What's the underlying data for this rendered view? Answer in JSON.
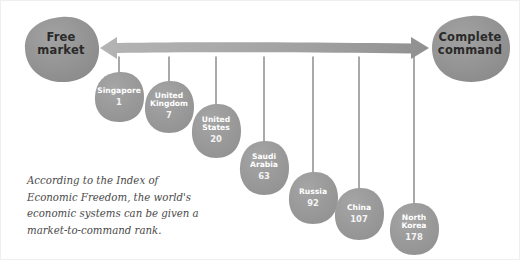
{
  "diagram": {
    "left_pole": {
      "line1": "Free",
      "line2": "market"
    },
    "right_pole": {
      "line1": "Complete",
      "line2": "command"
    },
    "axis": {
      "style": "double-headed-arrow",
      "direction": "bidirectional"
    },
    "caption": {
      "line1": "According to the Index of",
      "line2": "Economic Freedom, the world's",
      "line3": "economic systems can be given a",
      "line4": "market-to-command rank."
    },
    "colors": {
      "pole_blob": "#8f8f8f",
      "node_blob": "#9a9a9a",
      "arrow": "#a6a6a6",
      "stem": "#8c8c8c",
      "node_text": "#ffffff",
      "pole_text": "#2a2a2a",
      "caption_text": "#4a4a4a",
      "background": "#ffffff"
    }
  },
  "chart_data": {
    "type": "scatter",
    "xlabel": "Free market  ↔  Complete command",
    "ylabel": "Index of Economic Freedom rank",
    "categories": [
      "Singapore",
      "United Kingdom",
      "United States",
      "Saudi Arabia",
      "Russia",
      "China",
      "North Korea"
    ],
    "values": [
      1,
      7,
      20,
      63,
      92,
      107,
      178
    ],
    "nodes": [
      {
        "name_line1": "Singapore",
        "name_line2": "",
        "rank": "1",
        "x": 118,
        "y": 96,
        "rx": 24,
        "ry": 25,
        "stem_x": 118,
        "stem_top": 56,
        "stem_bottom": 74
      },
      {
        "name_line1": "United",
        "name_line2": "Kingdom",
        "rank": "7",
        "x": 168,
        "y": 106,
        "rx": 24,
        "ry": 26,
        "stem_x": 168,
        "stem_top": 56,
        "stem_bottom": 82
      },
      {
        "name_line1": "United",
        "name_line2": "States",
        "rank": "20",
        "x": 215,
        "y": 130,
        "rx": 24,
        "ry": 27,
        "stem_x": 215,
        "stem_top": 56,
        "stem_bottom": 105
      },
      {
        "name_line1": "Saudi",
        "name_line2": "Arabia",
        "rank": "63",
        "x": 263,
        "y": 167,
        "rx": 24,
        "ry": 27,
        "stem_x": 263,
        "stem_top": 56,
        "stem_bottom": 142
      },
      {
        "name_line1": "Russia",
        "name_line2": "",
        "rank": "92",
        "x": 312,
        "y": 197,
        "rx": 24,
        "ry": 26,
        "stem_x": 312,
        "stem_top": 56,
        "stem_bottom": 173
      },
      {
        "name_line1": "China",
        "name_line2": "",
        "rank": "107",
        "x": 358,
        "y": 213,
        "rx": 24,
        "ry": 26,
        "stem_x": 358,
        "stem_top": 56,
        "stem_bottom": 189
      },
      {
        "name_line1": "North",
        "name_line2": "Korea",
        "rank": "178",
        "x": 413,
        "y": 228,
        "rx": 24,
        "ry": 26,
        "stem_x": 413,
        "stem_top": 56,
        "stem_bottom": 203
      }
    ],
    "grid": false,
    "legend": "none"
  }
}
